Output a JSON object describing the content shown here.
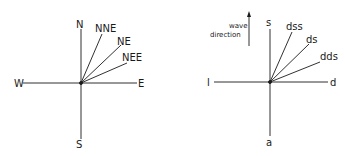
{
  "left_diagram": {
    "labels": {
      "north": "N",
      "south": "S",
      "west": "W",
      "east": "E",
      "nne": "NNE",
      "ne": "NE",
      "nee": "NEE"
    }
  },
  "right_diagram": {
    "labels": {
      "top": "s",
      "bottom": "a",
      "left": "l",
      "right": "d",
      "dss": "dss",
      "ds": "ds",
      "dds": "dds"
    },
    "wave_direction": {
      "line1": "wave",
      "line2": "direction"
    }
  },
  "colors": {
    "ink": "#1a1a1a",
    "background": "#ffffff"
  }
}
